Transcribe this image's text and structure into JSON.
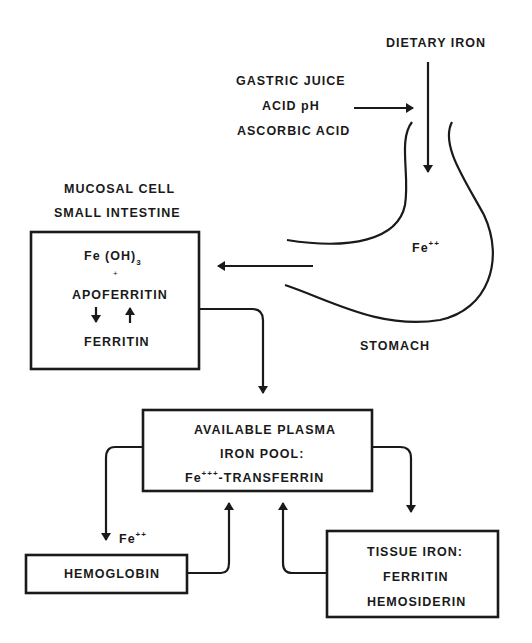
{
  "diagram": {
    "dietary_iron": "DIETARY IRON",
    "gastric": {
      "line1": "GASTRIC JUICE",
      "line2": "ACID pH",
      "line3": "ASCORBIC ACID"
    },
    "stomach": {
      "label": "STOMACH",
      "ion": "Fe",
      "ion_charge": "++"
    },
    "mucosal": {
      "title1": "MUCOSAL CELL",
      "title2": "SMALL INTESTINE",
      "line1": "Fe (OH)",
      "line1_sub": "3",
      "plus": "+",
      "line2": "APOFERRITIN",
      "line3": "FERRITIN"
    },
    "plasma": {
      "line1": "AVAILABLE PLASMA",
      "line2": "IRON POOL:",
      "line3_ion": "Fe",
      "line3_charge": "+++",
      "line3_rest": "-TRANSFERRIN"
    },
    "hemoglobin": {
      "label": "HEMOGLOBIN",
      "ion": "Fe",
      "ion_charge": "++"
    },
    "tissue": {
      "line1": "TISSUE IRON:",
      "line2": "FERRITIN",
      "line3": "HEMOSIDERIN"
    }
  }
}
